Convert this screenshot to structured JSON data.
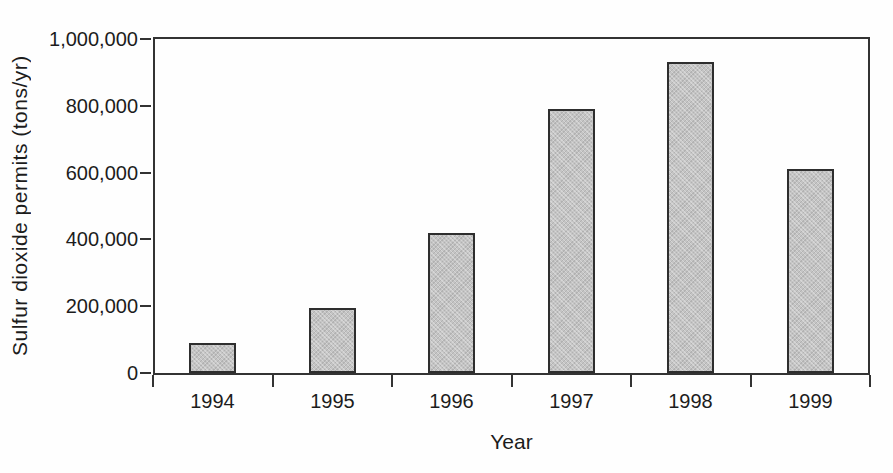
{
  "chart_data": {
    "type": "bar",
    "title": "",
    "xlabel": "Year",
    "ylabel": "Sulfur dioxide permits (tons/yr)",
    "categories": [
      "1994",
      "1995",
      "1996",
      "1997",
      "1998",
      "1999"
    ],
    "values": [
      90000,
      195000,
      420000,
      790000,
      930000,
      610000
    ],
    "ylim": [
      0,
      1000000
    ],
    "ytick_step": 200000,
    "ytick_labels": [
      "0",
      "200,000",
      "400,000",
      "600,000",
      "800,000",
      "1,000,000"
    ],
    "grid": false,
    "legend": "none",
    "frame": "full-box",
    "bar_fill_color": "#c4c4c4",
    "bar_hatch": "diagonal-crosshatch",
    "bar_border_color": "#2e2e2e",
    "axis_color": "#333333",
    "text_color": "#1c1c1c",
    "background_color": "#fefefe"
  }
}
